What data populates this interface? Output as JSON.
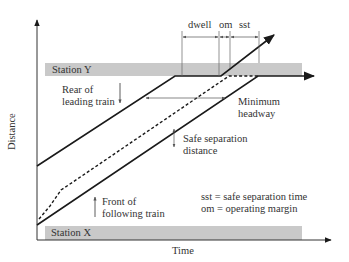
{
  "diagram": {
    "axes": {
      "x_label": "Time",
      "y_label": "Distance"
    },
    "stations": {
      "top": "Station Y",
      "bottom": "Station X"
    },
    "dimension_labels": {
      "dwell": "dwell",
      "om": "om",
      "sst": "sst"
    },
    "annotations": {
      "rear_leading_line1": "Rear of",
      "rear_leading_line2": "leading train",
      "front_following_line1": "Front of",
      "front_following_line2": "following train",
      "min_headway_line1": "Minimum",
      "min_headway_line2": "headway",
      "safe_sep_line1": "Safe separation",
      "safe_sep_line2": "distance"
    },
    "legend": {
      "sst_def": "sst = safe separation time",
      "om_def": "om = operating margin"
    },
    "colors": {
      "line": "#1a1a1a",
      "station_band": "#c9c9c9",
      "text": "#333333",
      "dim_line": "#555555"
    }
  }
}
